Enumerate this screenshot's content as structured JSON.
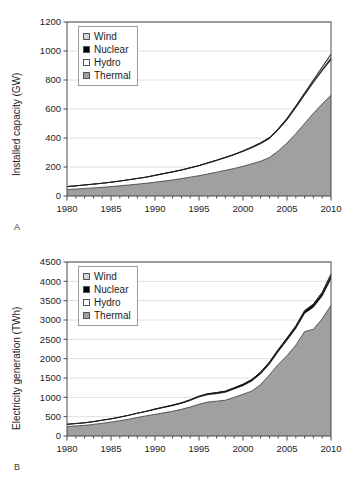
{
  "figure": {
    "panels": [
      {
        "id": "A",
        "label": "A",
        "legend": [
          {
            "name": "Wind",
            "color": "#d4d4d4"
          },
          {
            "name": "Nuclear",
            "color": "#000000"
          },
          {
            "name": "Hydro",
            "color": "#ffffff"
          },
          {
            "name": "Thermal",
            "color": "#a0a0a0"
          }
        ],
        "chart_data": {
          "type": "area",
          "stacked": true,
          "title": "",
          "xlabel": "",
          "ylabel": "Installed capacity (GW)",
          "xlim": [
            1980,
            2010
          ],
          "ylim": [
            0,
            1200
          ],
          "ytick_step": 200,
          "yticks": [
            0,
            200,
            400,
            600,
            800,
            1000,
            1200
          ],
          "xticks_labeled": [
            1980,
            1985,
            1990,
            1995,
            2000,
            2005,
            2010
          ],
          "xtick_minor_step": 1,
          "grid": "horizontal",
          "legend_position": "upper-left",
          "x": [
            1980,
            1981,
            1982,
            1983,
            1984,
            1985,
            1986,
            1987,
            1988,
            1989,
            1990,
            1991,
            1992,
            1993,
            1994,
            1995,
            1996,
            1997,
            1998,
            1999,
            2000,
            2001,
            2002,
            2003,
            2004,
            2005,
            2006,
            2007,
            2008,
            2009,
            2010
          ],
          "series": [
            {
              "name": "Thermal",
              "color": "#a0a0a0",
              "values": [
                45,
                48,
                52,
                56,
                60,
                65,
                70,
                76,
                82,
                88,
                95,
                103,
                111,
                120,
                130,
                140,
                152,
                164,
                177,
                190,
                205,
                222,
                240,
                265,
                310,
                365,
                430,
                500,
                570,
                635,
                695
              ]
            },
            {
              "name": "Hydro",
              "color": "#ffffff",
              "values": [
                20,
                22,
                24,
                26,
                28,
                30,
                33,
                36,
                39,
                42,
                46,
                50,
                54,
                58,
                63,
                68,
                74,
                80,
                87,
                94,
                102,
                110,
                120,
                130,
                145,
                160,
                178,
                196,
                212,
                228,
                245
              ]
            },
            {
              "name": "Nuclear",
              "color": "#000000",
              "values": [
                0,
                0,
                0,
                0,
                0,
                0,
                0,
                0,
                0,
                0,
                2,
                2,
                2,
                2,
                2,
                2,
                3,
                3,
                3,
                3,
                4,
                5,
                6,
                7,
                7,
                8,
                9,
                9,
                9,
                10,
                11
              ]
            },
            {
              "name": "Wind",
              "color": "#d4d4d4",
              "values": [
                0,
                0,
                0,
                0,
                0,
                0,
                0,
                0,
                0,
                0,
                0,
                0,
                0,
                0,
                0,
                0,
                0,
                0,
                0,
                0,
                0,
                1,
                1,
                1,
                2,
                3,
                4,
                6,
                10,
                17,
                28
              ]
            }
          ]
        }
      },
      {
        "id": "B",
        "label": "B",
        "legend": [
          {
            "name": "Wind",
            "color": "#d4d4d4"
          },
          {
            "name": "Nuclear",
            "color": "#000000"
          },
          {
            "name": "Hydro",
            "color": "#ffffff"
          },
          {
            "name": "Thermal",
            "color": "#a0a0a0"
          }
        ],
        "chart_data": {
          "type": "area",
          "stacked": true,
          "title": "",
          "xlabel": "",
          "ylabel": "Electricity generation (TWh)",
          "xlim": [
            1980,
            2010
          ],
          "ylim": [
            0,
            4500
          ],
          "ytick_step": 500,
          "yticks": [
            0,
            500,
            1000,
            1500,
            2000,
            2500,
            3000,
            3500,
            4000,
            4500
          ],
          "xticks_labeled": [
            1980,
            1985,
            1990,
            1995,
            2000,
            2005,
            2010
          ],
          "xtick_minor_step": 1,
          "grid": "horizontal",
          "legend_position": "upper-left",
          "x": [
            1980,
            1981,
            1982,
            1983,
            1984,
            1985,
            1986,
            1987,
            1988,
            1989,
            1990,
            1991,
            1992,
            1993,
            1994,
            1995,
            1996,
            1997,
            1998,
            1999,
            2000,
            2001,
            2002,
            2003,
            2004,
            2005,
            2006,
            2007,
            2008,
            2009,
            2010
          ],
          "series": [
            {
              "name": "Thermal",
              "color": "#a0a0a0",
              "values": [
                245,
                260,
                275,
                300,
                330,
                360,
                395,
                435,
                480,
                520,
                560,
                600,
                640,
                690,
                750,
                820,
                880,
                900,
                925,
                1000,
                1080,
                1160,
                1330,
                1580,
                1850,
                2080,
                2350,
                2700,
                2760,
                3030,
                3380
              ]
            },
            {
              "name": "Hydro",
              "color": "#ffffff",
              "values": [
                58,
                62,
                66,
                72,
                78,
                84,
                92,
                100,
                110,
                118,
                126,
                135,
                145,
                152,
                167,
                187,
                188,
                195,
                205,
                215,
                222,
                260,
                275,
                280,
                330,
                395,
                430,
                470,
                570,
                590,
                690
              ]
            },
            {
              "name": "Nuclear",
              "color": "#000000",
              "values": [
                0,
                0,
                0,
                0,
                0,
                0,
                0,
                0,
                0,
                0,
                12,
                14,
                15,
                17,
                20,
                23,
                25,
                28,
                30,
                33,
                36,
                40,
                45,
                48,
                52,
                56,
                60,
                63,
                68,
                72,
                76
              ]
            },
            {
              "name": "Wind",
              "color": "#d4d4d4",
              "values": [
                0,
                0,
                0,
                0,
                0,
                0,
                0,
                0,
                0,
                0,
                0,
                0,
                0,
                0,
                0,
                0,
                0,
                0,
                0,
                0,
                0,
                1,
                2,
                2,
                3,
                5,
                8,
                12,
                18,
                28,
                45
              ]
            }
          ]
        }
      }
    ]
  }
}
